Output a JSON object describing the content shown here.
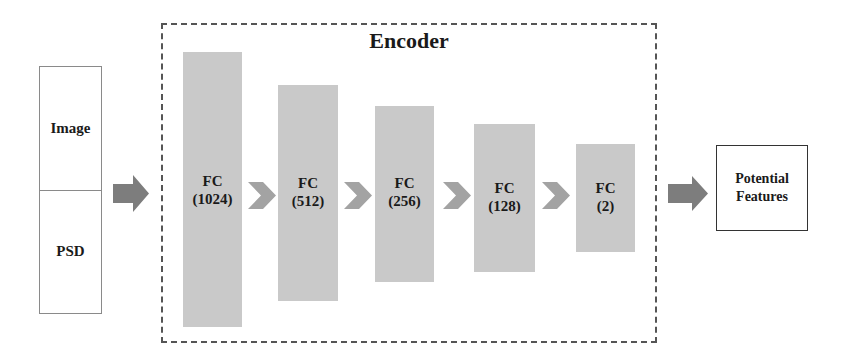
{
  "diagram": {
    "type": "encoder-architecture",
    "colors": {
      "bar_fill": "#c9c9c9",
      "arrow_fill": "#7d7d7d",
      "chevron_fill": "#a3a3a3",
      "dashed_border": "#555555",
      "input_border": "#8a8a8a",
      "output_border": "#333333"
    },
    "input": {
      "top_label": "Image",
      "bottom_label": "PSD"
    },
    "encoder": {
      "title": "Encoder",
      "layers": [
        {
          "type": "FC",
          "units": "(1024)"
        },
        {
          "type": "FC",
          "units": "(512)"
        },
        {
          "type": "FC",
          "units": "(256)"
        },
        {
          "type": "FC",
          "units": "(128)"
        },
        {
          "type": "FC",
          "units": "(2)"
        }
      ]
    },
    "output": {
      "line1": "Potential",
      "line2": "Features"
    },
    "arrows": [
      "block-arrow-right",
      "chevron-right",
      "chevron-right",
      "chevron-right",
      "chevron-right",
      "block-arrow-right"
    ]
  }
}
